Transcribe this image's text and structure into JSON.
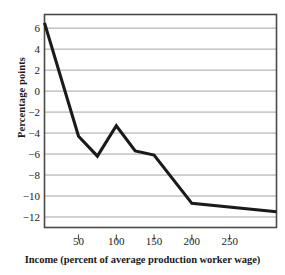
{
  "chart_data": {
    "type": "line",
    "title": "",
    "xlabel": "Income (percent of average production worker wage)",
    "ylabel": "Percentage points",
    "xlim": [
      5,
      312
    ],
    "ylim": [
      -13,
      7.3
    ],
    "xticks": [
      50,
      100,
      150,
      200,
      250
    ],
    "yticks": [
      6,
      4,
      2,
      0,
      -2,
      -4,
      -6,
      -8,
      -10,
      -12
    ],
    "ytick_labels": [
      "6",
      "4",
      "2",
      "0",
      "−2",
      "−4",
      "−6",
      "−8",
      "−10",
      "−12"
    ],
    "xtick_labels": [
      "50",
      "100",
      "150",
      "200",
      "250"
    ],
    "grid": "horizontal",
    "legend": "none",
    "series": [
      {
        "name": "Change in effective marginal tax rate",
        "color": "#1a1a1a",
        "x": [
          5,
          50,
          75,
          100,
          125,
          150,
          200,
          312
        ],
        "values": [
          6.5,
          -4.3,
          -6.2,
          -3.3,
          -5.7,
          -6.1,
          -10.7,
          -11.5
        ]
      }
    ]
  },
  "axes": {
    "y_axis_title": "Percentage points",
    "x_axis_title": "Income (percent of average production worker wage)"
  }
}
